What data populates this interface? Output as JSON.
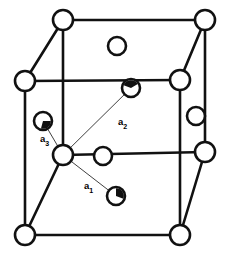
{
  "figure": {
    "background_color": "#ffffff",
    "line_color": "#111111",
    "atom_fill_color": "#ffffff",
    "wedge_fill_color": "#111111",
    "vector_line_color": "#2a2a2a",
    "width": 228,
    "height": 258
  },
  "labels": {
    "a1": {
      "text": "a",
      "sub": "1",
      "x": 84,
      "y": 186
    },
    "a2": {
      "text": "a",
      "sub": "2",
      "x": 118,
      "y": 122
    },
    "a3": {
      "text": "a",
      "sub": "3",
      "x": 40,
      "y": 139
    }
  },
  "vertices": [
    {
      "name": "back-top-left",
      "x": 63,
      "y": 20,
      "r": 10,
      "style": "open"
    },
    {
      "name": "back-top-right",
      "x": 205,
      "y": 20,
      "r": 10,
      "style": "open"
    },
    {
      "name": "back-bottom-left",
      "x": 63,
      "y": 155,
      "r": 10,
      "style": "open"
    },
    {
      "name": "back-bottom-right",
      "x": 205,
      "y": 152,
      "r": 10,
      "style": "open"
    },
    {
      "name": "front-top-left",
      "x": 25,
      "y": 81,
      "r": 10,
      "style": "open"
    },
    {
      "name": "front-top-right",
      "x": 180,
      "y": 80,
      "r": 10,
      "style": "open"
    },
    {
      "name": "front-bottom-left",
      "x": 25,
      "y": 235,
      "r": 10,
      "style": "open"
    },
    {
      "name": "front-bottom-right",
      "x": 180,
      "y": 235,
      "r": 10,
      "style": "open"
    }
  ],
  "face_atoms": [
    {
      "name": "top-face-center",
      "x": 117,
      "y": 46,
      "r": 9,
      "style": "open"
    },
    {
      "name": "right-face-center",
      "x": 196,
      "y": 116,
      "r": 9,
      "style": "open"
    },
    {
      "name": "bottom-face-center",
      "x": 103,
      "y": 156,
      "r": 9,
      "style": "open"
    },
    {
      "name": "back-face-center",
      "x": 131,
      "y": 88,
      "r": 9,
      "style": "wedge",
      "wedge_start_deg": 200,
      "wedge_end_deg": 330
    },
    {
      "name": "left-face-center",
      "x": 43,
      "y": 121,
      "r": 9,
      "style": "wedge",
      "wedge_start_deg": 0,
      "wedge_end_deg": 105
    },
    {
      "name": "front-face-center",
      "x": 116,
      "y": 196,
      "r": 9,
      "style": "wedge",
      "wedge_start_deg": 270,
      "wedge_end_deg": 20
    }
  ],
  "vectors": [
    {
      "name": "a1",
      "from_x": 63,
      "from_y": 155,
      "to_x": 116,
      "to_y": 196
    },
    {
      "name": "a2",
      "from_x": 63,
      "from_y": 155,
      "to_x": 131,
      "to_y": 88
    },
    {
      "name": "a3",
      "from_x": 63,
      "from_y": 155,
      "to_x": 43,
      "to_y": 121
    }
  ],
  "edges": [
    {
      "name": "back-top",
      "x1": 63,
      "y1": 20,
      "x2": 205,
      "y2": 20
    },
    {
      "name": "back-left",
      "x1": 63,
      "y1": 20,
      "x2": 63,
      "y2": 155
    },
    {
      "name": "back-right",
      "x1": 205,
      "y1": 20,
      "x2": 205,
      "y2": 152
    },
    {
      "name": "back-bottom",
      "x1": 63,
      "y1": 155,
      "x2": 205,
      "y2": 152
    },
    {
      "name": "front-top",
      "x1": 25,
      "y1": 81,
      "x2": 180,
      "y2": 80
    },
    {
      "name": "front-left",
      "x1": 25,
      "y1": 81,
      "x2": 25,
      "y2": 235
    },
    {
      "name": "front-right",
      "x1": 180,
      "y1": 80,
      "x2": 180,
      "y2": 235
    },
    {
      "name": "front-bottom",
      "x1": 25,
      "y1": 235,
      "x2": 180,
      "y2": 235
    },
    {
      "name": "connect-top-left",
      "x1": 63,
      "y1": 20,
      "x2": 25,
      "y2": 81
    },
    {
      "name": "connect-top-right",
      "x1": 205,
      "y1": 20,
      "x2": 180,
      "y2": 80
    },
    {
      "name": "connect-bottom-left",
      "x1": 63,
      "y1": 155,
      "x2": 25,
      "y2": 235
    },
    {
      "name": "connect-bottom-right",
      "x1": 205,
      "y1": 152,
      "x2": 180,
      "y2": 235
    }
  ]
}
